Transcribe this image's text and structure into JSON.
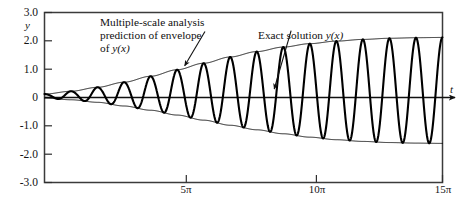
{
  "figure": {
    "title": "",
    "y_axis_name": "y",
    "x_axis_name": "t"
  },
  "annotations": {
    "envelope": {
      "line1": "Multiple-scale analysis",
      "line2": "prediction of envelope",
      "line3_prefix": "of ",
      "line3_math": "y(x)"
    },
    "exact": {
      "text_prefix": "Exact solution ",
      "text_math": "y(x)"
    }
  },
  "chart_data": {
    "type": "line",
    "title": "",
    "xlabel": "t",
    "ylabel": "y",
    "xlim": [
      0,
      47.1238898
    ],
    "ylim": [
      -3.0,
      3.0
    ],
    "grid": false,
    "legend": "annotations",
    "x_ticks": [
      {
        "value": 15.70796,
        "label": "5π"
      },
      {
        "value": 31.41593,
        "label": "10π"
      },
      {
        "value": 47.12389,
        "label": "15π"
      }
    ],
    "y_ticks": [
      {
        "value": 3.0,
        "label": "3.0"
      },
      {
        "value": 2.0,
        "label": "2.0"
      },
      {
        "value": 1.0,
        "label": "1.0"
      },
      {
        "value": 0.0,
        "label": "0"
      },
      {
        "value": -1.0,
        "label": "-1.0"
      },
      {
        "value": -2.0,
        "label": "-2.0"
      },
      {
        "value": -3.0,
        "label": "-3.0"
      }
    ],
    "series": [
      {
        "name": "Exact solution y(x)",
        "kind": "oscillation",
        "description": "Rapidly oscillating solution whose amplitude grows with t, bounded by the upper and lower envelope curves.",
        "linewidth": 2.1,
        "color": "#000000",
        "period": 3.14159,
        "phase_offset": 0.0
      },
      {
        "name": "Upper envelope (multiple-scale prediction)",
        "kind": "envelope-upper",
        "linewidth": 0.9,
        "color": "#000000",
        "points": [
          {
            "t": 0.0,
            "y": 0.12
          },
          {
            "t": 3.1416,
            "y": 0.22
          },
          {
            "t": 6.2832,
            "y": 0.36
          },
          {
            "t": 9.4248,
            "y": 0.54
          },
          {
            "t": 12.566,
            "y": 0.75
          },
          {
            "t": 15.708,
            "y": 0.98
          },
          {
            "t": 18.85,
            "y": 1.21
          },
          {
            "t": 21.991,
            "y": 1.43
          },
          {
            "t": 25.133,
            "y": 1.62
          },
          {
            "t": 28.274,
            "y": 1.78
          },
          {
            "t": 31.416,
            "y": 1.9
          },
          {
            "t": 34.558,
            "y": 1.99
          },
          {
            "t": 37.699,
            "y": 2.05
          },
          {
            "t": 40.841,
            "y": 2.09
          },
          {
            "t": 43.982,
            "y": 2.11
          },
          {
            "t": 47.124,
            "y": 2.12
          }
        ]
      },
      {
        "name": "Lower envelope (multiple-scale prediction)",
        "kind": "envelope-lower",
        "linewidth": 0.9,
        "color": "#000000",
        "points": [
          {
            "t": 0.0,
            "y": -0.02
          },
          {
            "t": 3.1416,
            "y": -0.08
          },
          {
            "t": 6.2832,
            "y": -0.17
          },
          {
            "t": 9.4248,
            "y": -0.3
          },
          {
            "t": 12.566,
            "y": -0.45
          },
          {
            "t": 15.708,
            "y": -0.62
          },
          {
            "t": 18.85,
            "y": -0.8
          },
          {
            "t": 21.991,
            "y": -0.98
          },
          {
            "t": 25.133,
            "y": -1.14
          },
          {
            "t": 28.274,
            "y": -1.28
          },
          {
            "t": 31.416,
            "y": -1.4
          },
          {
            "t": 34.558,
            "y": -1.49
          },
          {
            "t": 37.699,
            "y": -1.55
          },
          {
            "t": 40.841,
            "y": -1.59
          },
          {
            "t": 43.982,
            "y": -1.61
          },
          {
            "t": 47.124,
            "y": -1.62
          }
        ]
      },
      {
        "name": "Zero line (t axis)",
        "kind": "axis-line",
        "linewidth": 1.1,
        "color": "#000000"
      }
    ],
    "annotation_arrows": [
      {
        "label": "envelope-arrow",
        "from": [
          19.0,
          2.33
        ],
        "to": [
          16.6,
          1.12
        ]
      },
      {
        "label": "exact-arrow",
        "from": [
          29.2,
          2.36
        ],
        "to": [
          27.2,
          0.3
        ]
      }
    ]
  },
  "colors": {
    "ink": "#000000",
    "frame": "#3a3a3a",
    "background": "#ffffff"
  }
}
